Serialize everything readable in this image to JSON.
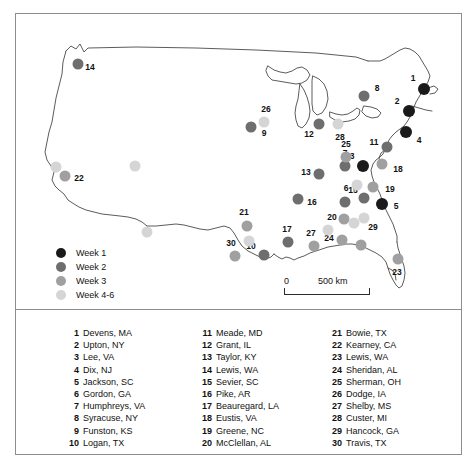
{
  "figure": {
    "type": "map"
  },
  "legend": {
    "items": [
      {
        "label": "Week 1",
        "color": "#1a1a1a"
      },
      {
        "label": "Week 2",
        "color": "#6e6e6e"
      },
      {
        "label": "Week 3",
        "color": "#a0a0a0"
      },
      {
        "label": "Week 4-6",
        "color": "#d5d5d5"
      }
    ]
  },
  "scale_bar": {
    "zero_label": "0",
    "distance_label": "500 km"
  },
  "map_points": [
    {
      "id": "1",
      "label": "1",
      "x": 408,
      "y": 75,
      "r": 6.0,
      "color": "#1a1a1a",
      "lx": 397,
      "ly": 64
    },
    {
      "id": "2",
      "label": "2",
      "x": 393,
      "y": 97,
      "r": 6.0,
      "color": "#1a1a1a",
      "lx": 381,
      "ly": 87
    },
    {
      "id": "3",
      "label": "3",
      "x": 347,
      "y": 152,
      "r": 6.0,
      "color": "#1a1a1a",
      "lx": 336,
      "ly": 142
    },
    {
      "id": "4",
      "label": "4",
      "x": 390,
      "y": 118,
      "r": 6.0,
      "color": "#1a1a1a",
      "lx": 403,
      "ly": 126
    },
    {
      "id": "5",
      "label": "5",
      "x": 366,
      "y": 190,
      "r": 6.0,
      "color": "#1a1a1a",
      "lx": 380,
      "ly": 192
    },
    {
      "id": "6",
      "label": "6",
      "x": 329,
      "y": 188,
      "r": 5.5,
      "color": "#6e6e6e",
      "lx": 330,
      "ly": 174
    },
    {
      "id": "7",
      "label": "7",
      "x": 329,
      "y": 152,
      "r": 5.5,
      "color": "#6e6e6e",
      "lx": 329,
      "ly": 139
    },
    {
      "id": "8",
      "label": "8",
      "x": 348,
      "y": 82,
      "r": 5.5,
      "color": "#6e6e6e",
      "lx": 361,
      "ly": 74
    },
    {
      "id": "9",
      "label": "9",
      "x": 235,
      "y": 113,
      "r": 5.5,
      "color": "#6e6e6e",
      "lx": 248,
      "ly": 119
    },
    {
      "id": "10",
      "label": "10",
      "x": 248,
      "y": 241,
      "r": 5.5,
      "color": "#6e6e6e",
      "lx": 235,
      "ly": 232
    },
    {
      "id": "11",
      "label": "11",
      "x": 371,
      "y": 133,
      "r": 5.5,
      "color": "#6e6e6e",
      "lx": 358,
      "ly": 128
    },
    {
      "id": "12",
      "label": "12",
      "x": 303,
      "y": 110,
      "r": 5.5,
      "color": "#6e6e6e",
      "lx": 293,
      "ly": 120
    },
    {
      "id": "13",
      "label": "13",
      "x": 303,
      "y": 160,
      "r": 5.5,
      "color": "#6e6e6e",
      "lx": 290,
      "ly": 158
    },
    {
      "id": "14",
      "label": "14",
      "x": 62,
      "y": 50,
      "r": 5.5,
      "color": "#6e6e6e",
      "lx": 74,
      "ly": 53
    },
    {
      "id": "15",
      "label": "15",
      "x": 348,
      "y": 184,
      "r": 5.5,
      "color": "#6e6e6e",
      "lx": 337,
      "ly": 176
    },
    {
      "id": "16",
      "label": "16",
      "x": 282,
      "y": 185,
      "r": 5.5,
      "color": "#6e6e6e",
      "lx": 296,
      "ly": 188
    },
    {
      "id": "17",
      "label": "17",
      "x": 272,
      "y": 228,
      "r": 5.5,
      "color": "#6e6e6e",
      "lx": 271,
      "ly": 215
    },
    {
      "id": "18",
      "label": "18",
      "x": 366,
      "y": 150,
      "r": 5.5,
      "color": "#a0a0a0",
      "lx": 382,
      "ly": 155
    },
    {
      "id": "19",
      "label": "19",
      "x": 357,
      "y": 173,
      "r": 5.5,
      "color": "#a0a0a0",
      "lx": 374,
      "ly": 175
    },
    {
      "id": "20",
      "label": "20",
      "x": 328,
      "y": 205,
      "r": 5.5,
      "color": "#a0a0a0",
      "lx": 316,
      "ly": 203
    },
    {
      "id": "21",
      "label": "21",
      "x": 231,
      "y": 212,
      "r": 5.5,
      "color": "#a0a0a0",
      "lx": 228,
      "ly": 198
    },
    {
      "id": "22",
      "label": "22",
      "x": 49,
      "y": 162,
      "r": 5.5,
      "color": "#a0a0a0",
      "lx": 63,
      "ly": 164
    },
    {
      "id": "23",
      "label": "23",
      "x": 382,
      "y": 245,
      "r": 5.5,
      "color": "#a0a0a0",
      "lx": 381,
      "ly": 258
    },
    {
      "id": "24",
      "label": "24",
      "x": 326,
      "y": 226,
      "r": 5.5,
      "color": "#a0a0a0",
      "lx": 313,
      "ly": 224
    },
    {
      "id": "25",
      "label": "25",
      "x": 330,
      "y": 143,
      "r": 5.5,
      "color": "#a0a0a0",
      "lx": 330,
      "ly": 130
    },
    {
      "id": "26",
      "label": "26",
      "x": 248,
      "y": 108,
      "r": 5.5,
      "color": "#d5d5d5",
      "lx": 250,
      "ly": 95
    },
    {
      "id": "27",
      "label": "27",
      "x": 298,
      "y": 232,
      "r": 5.5,
      "color": "#a0a0a0",
      "lx": 295,
      "ly": 219
    },
    {
      "id": "28",
      "label": "28",
      "x": 322,
      "y": 110,
      "r": 5.5,
      "color": "#d5d5d5",
      "lx": 324,
      "ly": 123
    },
    {
      "id": "29",
      "label": "29",
      "x": 348,
      "y": 204,
      "r": 5.5,
      "color": "#d5d5d5",
      "lx": 357,
      "ly": 213
    },
    {
      "id": "30",
      "label": "30",
      "x": 219,
      "y": 242,
      "r": 5.5,
      "color": "#a0a0a0",
      "lx": 215,
      "ly": 229
    },
    {
      "id": "u1",
      "label": "",
      "x": 40,
      "y": 153,
      "r": 5.5,
      "color": "#d5d5d5",
      "lx": 0,
      "ly": 0
    },
    {
      "id": "u2",
      "label": "",
      "x": 233,
      "y": 227,
      "r": 5.5,
      "color": "#d5d5d5",
      "lx": 0,
      "ly": 0
    },
    {
      "id": "u3",
      "label": "",
      "x": 131,
      "y": 218,
      "r": 5.5,
      "color": "#d5d5d5",
      "lx": 0,
      "ly": 0
    },
    {
      "id": "u4",
      "label": "",
      "x": 119,
      "y": 152,
      "r": 5.5,
      "color": "#d5d5d5",
      "lx": 0,
      "ly": 0
    },
    {
      "id": "u5",
      "label": "",
      "x": 341,
      "y": 171,
      "r": 5.5,
      "color": "#d5d5d5",
      "lx": 0,
      "ly": 0
    },
    {
      "id": "u6",
      "label": "",
      "x": 312,
      "y": 216,
      "r": 5.5,
      "color": "#d5d5d5",
      "lx": 0,
      "ly": 0
    },
    {
      "id": "u7",
      "label": "",
      "x": 338,
      "y": 209,
      "r": 5.5,
      "color": "#d5d5d5",
      "lx": 0,
      "ly": 0
    },
    {
      "id": "u8",
      "label": "",
      "x": 345,
      "y": 231,
      "r": 5.5,
      "color": "#a0a0a0",
      "lx": 0,
      "ly": 0
    }
  ],
  "camp_list": {
    "column_1": [
      {
        "num": "1",
        "name": "Devens, MA"
      },
      {
        "num": "2",
        "name": "Upton, NY"
      },
      {
        "num": "3",
        "name": "Lee, VA"
      },
      {
        "num": "4",
        "name": "Dix, NJ"
      },
      {
        "num": "5",
        "name": "Jackson, SC"
      },
      {
        "num": "6",
        "name": "Gordon, GA"
      },
      {
        "num": "7",
        "name": "Humphreys, VA"
      },
      {
        "num": "8",
        "name": "Syracuse, NY"
      },
      {
        "num": "9",
        "name": "Funston, KS"
      },
      {
        "num": "10",
        "name": "Logan, TX"
      }
    ],
    "column_2": [
      {
        "num": "11",
        "name": "Meade, MD"
      },
      {
        "num": "12",
        "name": "Grant, IL"
      },
      {
        "num": "13",
        "name": "Taylor, KY"
      },
      {
        "num": "14",
        "name": "Lewis, WA"
      },
      {
        "num": "15",
        "name": "Sevier, SC"
      },
      {
        "num": "16",
        "name": "Pike, AR"
      },
      {
        "num": "17",
        "name": "Beauregard, LA"
      },
      {
        "num": "18",
        "name": "Eustis, VA"
      },
      {
        "num": "19",
        "name": "Greene, NC"
      },
      {
        "num": "20",
        "name": "McClellan, AL"
      }
    ],
    "column_3": [
      {
        "num": "21",
        "name": "Bowie, TX"
      },
      {
        "num": "22",
        "name": "Kearney, CA"
      },
      {
        "num": "23",
        "name": "Lewis, WA"
      },
      {
        "num": "24",
        "name": "Sheridan, AL"
      },
      {
        "num": "25",
        "name": "Sherman, OH"
      },
      {
        "num": "26",
        "name": "Dodge, IA"
      },
      {
        "num": "27",
        "name": "Shelby, MS"
      },
      {
        "num": "28",
        "name": "Custer, MI"
      },
      {
        "num": "29",
        "name": "Hancock, GA"
      },
      {
        "num": "30",
        "name": "Travis, TX"
      }
    ]
  }
}
